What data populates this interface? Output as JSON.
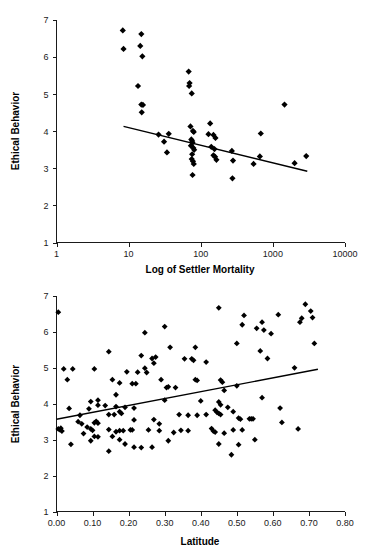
{
  "figure": {
    "panels": [
      {
        "id": "settler-mortality",
        "ylabel": "Ethical Behavior",
        "xlabel": "Log of Settler Mortality"
      },
      {
        "id": "latitude",
        "ylabel": "Ethical Behavior",
        "xlabel": "Latitude"
      }
    ]
  },
  "chart_data": [
    {
      "type": "scatter",
      "title": "",
      "xlabel": "Log of Settler Mortality",
      "ylabel": "Ethical Behavior",
      "xscale": "log",
      "xlim": [
        1,
        10000
      ],
      "ylim": [
        1,
        7
      ],
      "xticks": [
        1,
        10,
        100,
        1000,
        10000
      ],
      "xticklabels": [
        "1",
        "10",
        "100",
        "1000",
        "10000"
      ],
      "yticks": [
        1,
        2,
        3,
        4,
        5,
        6,
        7
      ],
      "yticklabels": [
        "1",
        "2",
        "3",
        "4",
        "5",
        "6",
        "7"
      ],
      "grid": false,
      "legend": null,
      "marker": "diamond",
      "marker_color": "#000000",
      "points": [
        [
          8.3,
          6.72
        ],
        [
          8.5,
          6.22
        ],
        [
          15.0,
          6.62
        ],
        [
          14.5,
          6.3
        ],
        [
          15.5,
          6.02
        ],
        [
          13.5,
          5.22
        ],
        [
          15.0,
          4.72
        ],
        [
          15.8,
          4.71
        ],
        [
          15.2,
          4.51
        ],
        [
          68.0,
          5.61
        ],
        [
          70.0,
          5.3
        ],
        [
          69.0,
          5.22
        ],
        [
          75.0,
          5.02
        ],
        [
          135.0,
          4.21
        ],
        [
          1450.0,
          4.72
        ],
        [
          72.0,
          4.13
        ],
        [
          78.0,
          4.01
        ],
        [
          80.0,
          3.98
        ],
        [
          26.0,
          3.91
        ],
        [
          36.0,
          3.93
        ],
        [
          128.0,
          3.92
        ],
        [
          150.0,
          3.9
        ],
        [
          680.0,
          3.94
        ],
        [
          31.0,
          3.72
        ],
        [
          74.0,
          3.78
        ],
        [
          76.0,
          3.74
        ],
        [
          77.0,
          3.69
        ],
        [
          160.0,
          3.82
        ],
        [
          73.0,
          3.61
        ],
        [
          79.0,
          3.55
        ],
        [
          81.0,
          3.5
        ],
        [
          140.0,
          3.58
        ],
        [
          155.0,
          3.52
        ],
        [
          270.0,
          3.47
        ],
        [
          34.0,
          3.43
        ],
        [
          76.0,
          3.38
        ],
        [
          150.0,
          3.35
        ],
        [
          158.0,
          3.31
        ],
        [
          165.0,
          3.23
        ],
        [
          660.0,
          3.32
        ],
        [
          2900.0,
          3.33
        ],
        [
          75.0,
          3.25
        ],
        [
          78.0,
          3.19
        ],
        [
          80.0,
          3.12
        ],
        [
          280.0,
          3.21
        ],
        [
          540.0,
          3.12
        ],
        [
          2000.0,
          3.14
        ],
        [
          77.0,
          2.82
        ],
        [
          275.0,
          2.73
        ]
      ],
      "trend_line": {
        "x": [
          8.5,
          3000
        ],
        "y": [
          4.13,
          2.92
        ],
        "description": "negative linear fit on log x"
      }
    },
    {
      "type": "scatter",
      "title": "",
      "xlabel": "Latitude",
      "ylabel": "Ethical Behavior",
      "xscale": "linear",
      "xlim": [
        0.0,
        0.8
      ],
      "ylim": [
        1,
        7
      ],
      "xticks": [
        0.0,
        0.1,
        0.2,
        0.3,
        0.4,
        0.5,
        0.6,
        0.7,
        0.8
      ],
      "xticklabels": [
        "0.00",
        "0.10",
        "0.20",
        "0.30",
        "0.40",
        "0.50",
        "0.60",
        "0.70",
        "0.80"
      ],
      "yticks": [
        1,
        2,
        3,
        4,
        5,
        6,
        7
      ],
      "yticklabels": [
        "1",
        "2",
        "3",
        "4",
        "5",
        "6",
        "7"
      ],
      "grid": false,
      "legend": null,
      "marker": "diamond",
      "marker_color": "#000000",
      "points": [
        [
          0.005,
          6.55
        ],
        [
          0.45,
          6.67
        ],
        [
          0.69,
          6.77
        ],
        [
          0.705,
          6.58
        ],
        [
          0.71,
          6.4
        ],
        [
          0.68,
          6.38
        ],
        [
          0.675,
          6.27
        ],
        [
          0.615,
          6.48
        ],
        [
          0.52,
          6.46
        ],
        [
          0.515,
          6.2
        ],
        [
          0.555,
          6.1
        ],
        [
          0.57,
          6.27
        ],
        [
          0.575,
          6.05
        ],
        [
          0.595,
          5.95
        ],
        [
          0.3,
          6.15
        ],
        [
          0.245,
          5.98
        ],
        [
          0.715,
          5.68
        ],
        [
          0.5,
          5.68
        ],
        [
          0.565,
          5.47
        ],
        [
          0.585,
          5.26
        ],
        [
          0.315,
          5.57
        ],
        [
          0.385,
          5.57
        ],
        [
          0.145,
          5.45
        ],
        [
          0.235,
          5.34
        ],
        [
          0.265,
          5.26
        ],
        [
          0.275,
          5.3
        ],
        [
          0.27,
          5.13
        ],
        [
          0.355,
          5.25
        ],
        [
          0.375,
          5.25
        ],
        [
          0.38,
          5.21
        ],
        [
          0.415,
          5.16
        ],
        [
          0.245,
          4.99
        ],
        [
          0.25,
          4.87
        ],
        [
          0.02,
          4.97
        ],
        [
          0.045,
          4.97
        ],
        [
          0.105,
          4.97
        ],
        [
          0.66,
          5.0
        ],
        [
          0.195,
          4.89
        ],
        [
          0.225,
          4.88
        ],
        [
          0.03,
          4.67
        ],
        [
          0.155,
          4.67
        ],
        [
          0.29,
          4.67
        ],
        [
          0.385,
          4.67
        ],
        [
          0.39,
          4.65
        ],
        [
          0.455,
          4.66
        ],
        [
          0.46,
          4.6
        ],
        [
          0.175,
          4.58
        ],
        [
          0.21,
          4.56
        ],
        [
          0.22,
          4.56
        ],
        [
          0.305,
          4.45
        ],
        [
          0.31,
          4.47
        ],
        [
          0.33,
          4.45
        ],
        [
          0.5,
          4.5
        ],
        [
          0.465,
          4.37
        ],
        [
          0.165,
          4.25
        ],
        [
          0.57,
          4.17
        ],
        [
          0.095,
          4.06
        ],
        [
          0.115,
          4.1
        ],
        [
          0.3,
          4.1
        ],
        [
          0.4,
          4.08
        ],
        [
          0.45,
          4.05
        ],
        [
          0.455,
          3.97
        ],
        [
          0.475,
          3.9
        ],
        [
          0.115,
          3.96
        ],
        [
          0.135,
          3.95
        ],
        [
          0.165,
          3.92
        ],
        [
          0.19,
          3.9
        ],
        [
          0.215,
          3.88
        ],
        [
          0.035,
          3.87
        ],
        [
          0.09,
          3.86
        ],
        [
          0.44,
          3.82
        ],
        [
          0.445,
          3.76
        ],
        [
          0.45,
          3.73
        ],
        [
          0.455,
          3.7
        ],
        [
          0.34,
          3.7
        ],
        [
          0.365,
          3.68
        ],
        [
          0.39,
          3.68
        ],
        [
          0.415,
          3.7
        ],
        [
          0.62,
          3.88
        ],
        [
          0.145,
          3.7
        ],
        [
          0.16,
          3.7
        ],
        [
          0.175,
          3.78
        ],
        [
          0.18,
          3.73
        ],
        [
          0.065,
          3.68
        ],
        [
          0.49,
          3.78
        ],
        [
          0.505,
          3.6
        ],
        [
          0.535,
          3.58
        ],
        [
          0.54,
          3.58
        ],
        [
          0.545,
          3.58
        ],
        [
          0.215,
          3.55
        ],
        [
          0.27,
          3.56
        ],
        [
          0.51,
          3.57
        ],
        [
          0.06,
          3.5
        ],
        [
          0.105,
          3.47
        ],
        [
          0.11,
          3.51
        ],
        [
          0.115,
          3.46
        ],
        [
          0.07,
          3.44
        ],
        [
          0.285,
          3.44
        ],
        [
          0.625,
          3.48
        ],
        [
          0.005,
          3.3
        ],
        [
          0.01,
          3.27
        ],
        [
          0.012,
          3.32
        ],
        [
          0.015,
          3.24
        ],
        [
          0.085,
          3.35
        ],
        [
          0.095,
          3.3
        ],
        [
          0.1,
          3.26
        ],
        [
          0.145,
          3.28
        ],
        [
          0.165,
          3.22
        ],
        [
          0.175,
          3.25
        ],
        [
          0.185,
          3.25
        ],
        [
          0.205,
          3.27
        ],
        [
          0.21,
          3.27
        ],
        [
          0.255,
          3.27
        ],
        [
          0.285,
          3.25
        ],
        [
          0.325,
          3.2
        ],
        [
          0.345,
          3.26
        ],
        [
          0.365,
          3.25
        ],
        [
          0.43,
          3.31
        ],
        [
          0.435,
          3.24
        ],
        [
          0.44,
          3.21
        ],
        [
          0.465,
          3.18
        ],
        [
          0.49,
          3.27
        ],
        [
          0.515,
          3.27
        ],
        [
          0.67,
          3.3
        ],
        [
          0.075,
          3.17
        ],
        [
          0.105,
          3.09
        ],
        [
          0.115,
          3.08
        ],
        [
          0.155,
          3.09
        ],
        [
          0.095,
          2.97
        ],
        [
          0.175,
          3.0
        ],
        [
          0.31,
          2.97
        ],
        [
          0.45,
          2.88
        ],
        [
          0.505,
          2.86
        ],
        [
          0.55,
          3.0
        ],
        [
          0.04,
          2.87
        ],
        [
          0.19,
          2.88
        ],
        [
          0.215,
          2.79
        ],
        [
          0.235,
          2.78
        ],
        [
          0.265,
          2.79
        ],
        [
          0.145,
          2.68
        ],
        [
          0.485,
          2.58
        ]
      ],
      "trend_line": {
        "x": [
          0.0,
          0.725
        ],
        "y": [
          3.57,
          4.96
        ],
        "description": "positive linear fit"
      }
    }
  ]
}
